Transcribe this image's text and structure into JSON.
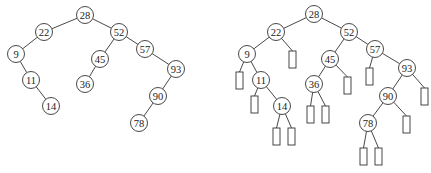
{
  "diagram": {
    "left_tree": {
      "title": "Binary search tree",
      "nodes": [
        {
          "id": "L28",
          "label": "28",
          "x": 85,
          "y": 15
        },
        {
          "id": "L22",
          "label": "22",
          "x": 44,
          "y": 32
        },
        {
          "id": "L52",
          "label": "52",
          "x": 119,
          "y": 32
        },
        {
          "id": "L9",
          "label": "9",
          "x": 16,
          "y": 54
        },
        {
          "id": "L57",
          "label": "57",
          "x": 145,
          "y": 49
        },
        {
          "id": "L45",
          "label": "45",
          "x": 100,
          "y": 59
        },
        {
          "id": "L93",
          "label": "93",
          "x": 176,
          "y": 69
        },
        {
          "id": "L11",
          "label": "11",
          "x": 31,
          "y": 80
        },
        {
          "id": "L36",
          "label": "36",
          "x": 85,
          "y": 84
        },
        {
          "id": "L90",
          "label": "90",
          "x": 158,
          "y": 96
        },
        {
          "id": "L14",
          "label": "14",
          "x": 51,
          "y": 106
        },
        {
          "id": "L78",
          "label": "78",
          "x": 139,
          "y": 123
        }
      ],
      "edges": [
        [
          "L28",
          "L22"
        ],
        [
          "L28",
          "L52"
        ],
        [
          "L22",
          "L9"
        ],
        [
          "L9",
          "L11"
        ],
        [
          "L11",
          "L14"
        ],
        [
          "L52",
          "L45"
        ],
        [
          "L45",
          "L36"
        ],
        [
          "L52",
          "L57"
        ],
        [
          "L57",
          "L93"
        ],
        [
          "L93",
          "L90"
        ],
        [
          "L90",
          "L78"
        ]
      ]
    },
    "right_tree": {
      "title": "Extended binary tree with external nodes",
      "nodes": [
        {
          "id": "R28",
          "label": "28",
          "x": 314,
          "y": 14
        },
        {
          "id": "R22",
          "label": "22",
          "x": 276,
          "y": 32
        },
        {
          "id": "R52",
          "label": "52",
          "x": 349,
          "y": 32
        },
        {
          "id": "R9",
          "label": "9",
          "x": 247,
          "y": 54
        },
        {
          "id": "R45",
          "label": "45",
          "x": 330,
          "y": 59
        },
        {
          "id": "R57",
          "label": "57",
          "x": 375,
          "y": 49
        },
        {
          "id": "R11",
          "label": "11",
          "x": 261,
          "y": 80
        },
        {
          "id": "R36",
          "label": "36",
          "x": 314,
          "y": 84
        },
        {
          "id": "R93",
          "label": "93",
          "x": 407,
          "y": 68
        },
        {
          "id": "R14",
          "label": "14",
          "x": 282,
          "y": 106
        },
        {
          "id": "R90",
          "label": "90",
          "x": 388,
          "y": 96
        },
        {
          "id": "R78",
          "label": "78",
          "x": 368,
          "y": 123
        }
      ],
      "edges": [
        [
          "R28",
          "R22"
        ],
        [
          "R28",
          "R52"
        ],
        [
          "R22",
          "R9"
        ],
        [
          "R9",
          "R11"
        ],
        [
          "R11",
          "R14"
        ],
        [
          "R52",
          "R45"
        ],
        [
          "R45",
          "R36"
        ],
        [
          "R52",
          "R57"
        ],
        [
          "R57",
          "R93"
        ],
        [
          "R93",
          "R90"
        ],
        [
          "R90",
          "R78"
        ]
      ],
      "external_nodes": [
        {
          "parent": "R22",
          "x": 289,
          "y": 51
        },
        {
          "parent": "R9",
          "x": 236,
          "y": 72
        },
        {
          "parent": "R11",
          "x": 251,
          "y": 96
        },
        {
          "parent": "R14",
          "x": 273,
          "y": 128
        },
        {
          "parent": "R14",
          "x": 288,
          "y": 128
        },
        {
          "parent": "R45",
          "x": 344,
          "y": 77
        },
        {
          "parent": "R36",
          "x": 307,
          "y": 106
        },
        {
          "parent": "R36",
          "x": 322,
          "y": 106
        },
        {
          "parent": "R57",
          "x": 366,
          "y": 68
        },
        {
          "parent": "R93",
          "x": 421,
          "y": 88
        },
        {
          "parent": "R90",
          "x": 403,
          "y": 116
        },
        {
          "parent": "R78",
          "x": 360,
          "y": 148
        },
        {
          "parent": "R78",
          "x": 375,
          "y": 148
        }
      ]
    },
    "node_radius": 8.5,
    "external_size": {
      "w": 7,
      "h": 17
    }
  }
}
